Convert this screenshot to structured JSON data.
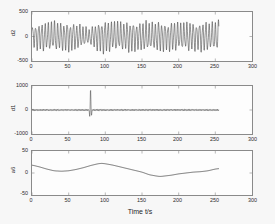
{
  "figure": {
    "background_color": "#f7f7f7",
    "plot_background_color": "#fdfdfd",
    "axis_color": "#8a8a8a",
    "line_color": "#3a3a3a",
    "xlabel": "Time t/s"
  },
  "chart_data": [
    {
      "type": "line",
      "title": "",
      "ylabel": "d2",
      "xlabel": "",
      "xlim": [
        0,
        300
      ],
      "ylim": [
        -500,
        500
      ],
      "xticks": [
        0,
        50,
        100,
        150,
        200,
        250,
        300
      ],
      "yticks": [
        -500,
        0,
        500
      ],
      "xticklabels": [
        "0",
        "50",
        "100",
        "150",
        "200",
        "250",
        "300"
      ],
      "yticklabels": [
        "-500",
        "0",
        "500"
      ],
      "grid": false,
      "legend": null,
      "series": [
        {
          "name": "d2",
          "description": "dense high-frequency oscillation, period about 4.3 s, amplitude envelope varies between 120 and 300, amplitude minimum near t=78",
          "x": [
            0,
            5,
            10,
            15,
            20,
            25,
            30,
            35,
            40,
            45,
            50,
            55,
            60,
            65,
            70,
            75,
            78,
            82,
            86,
            90,
            95,
            100,
            105,
            110,
            115,
            120,
            125,
            130,
            135,
            140,
            145,
            150,
            155,
            160,
            165,
            170,
            175,
            180,
            185,
            190,
            195,
            200,
            205,
            210,
            215,
            220,
            225,
            230,
            235,
            240,
            245,
            250,
            255
          ],
          "envelope": [
            190,
            215,
            235,
            250,
            240,
            255,
            265,
            250,
            235,
            245,
            255,
            240,
            225,
            205,
            180,
            150,
            130,
            175,
            215,
            250,
            275,
            290,
            270,
            250,
            265,
            250,
            235,
            260,
            270,
            250,
            235,
            255,
            265,
            245,
            230,
            250,
            265,
            245,
            235,
            255,
            260,
            240,
            230,
            250,
            265,
            245,
            235,
            255,
            265,
            245,
            230,
            255,
            270
          ]
        }
      ]
    },
    {
      "type": "line",
      "title": "",
      "ylabel": "d1",
      "xlabel": "",
      "xlim": [
        0,
        300
      ],
      "ylim": [
        -1000,
        1000
      ],
      "xticks": [
        0,
        50,
        100,
        150,
        200,
        250,
        300
      ],
      "yticks": [
        -1000,
        0,
        1000
      ],
      "xticklabels": [
        "0",
        "50",
        "100",
        "150",
        "200",
        "250",
        "300"
      ],
      "yticklabels": [
        "-1000",
        "0",
        "1000"
      ],
      "grid": false,
      "legend": null,
      "series": [
        {
          "name": "d1",
          "description": "low amplitude high-frequency noise near zero, amplitude about 40, with a single large transient spike at t=80 reaching +800 and -500",
          "baseline_amplitude": 40,
          "spike_center": 80,
          "spike_max": 800,
          "spike_min": -500
        }
      ]
    },
    {
      "type": "line",
      "title": "",
      "ylabel": "a6",
      "xlabel": "Time t/s",
      "xlim": [
        0,
        300
      ],
      "ylim": [
        -50,
        50
      ],
      "xticks": [
        0,
        50,
        100,
        150,
        200,
        250,
        300
      ],
      "yticks": [
        -50,
        0,
        50
      ],
      "xticklabels": [
        "0",
        "50",
        "100",
        "150",
        "200",
        "250",
        "300"
      ],
      "yticklabels": [
        "-50",
        "0",
        "50"
      ],
      "grid": false,
      "legend": null,
      "series": [
        {
          "name": "a6",
          "description": "smooth slow-varying approximation trend",
          "x": [
            0,
            10,
            20,
            30,
            40,
            50,
            60,
            70,
            80,
            90,
            95,
            100,
            110,
            120,
            130,
            140,
            150,
            160,
            170,
            175,
            180,
            190,
            200,
            210,
            220,
            230,
            240,
            250,
            255
          ],
          "y": [
            18,
            14,
            9,
            5,
            4,
            5,
            8,
            12,
            17,
            21,
            22,
            21,
            18,
            14,
            10,
            6,
            2,
            -4,
            -7,
            -8,
            -7,
            -5,
            -2,
            0,
            2,
            3,
            5,
            9,
            10
          ]
        }
      ]
    }
  ]
}
